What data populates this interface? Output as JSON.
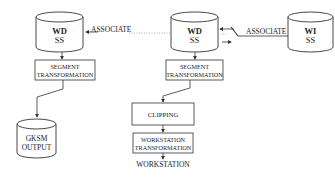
{
  "stores": {
    "wdss_left": {
      "line1": "WD",
      "line2": "SS"
    },
    "wdss_center": {
      "line1": "WD",
      "line2": "SS"
    },
    "wiss": {
      "line1": "WI",
      "line2": "SS"
    },
    "gksm": {
      "line1": "GKSM",
      "line2": "OUTPUT"
    }
  },
  "processes": {
    "seg_left": {
      "line1": "SEGMENT",
      "line2": "TRANSFORMATION"
    },
    "seg_center": {
      "line1": "SEGMENT",
      "line2": "TRANSFORMATION"
    },
    "clipping": {
      "label": "CLIPPING"
    },
    "ws_transform": {
      "line1": "WORKSTATION",
      "line2": "TRANSFORMATION"
    }
  },
  "labels": {
    "associate_left": "ASSOCIATE",
    "associate_right": "ASSOCIATE",
    "workstation_output": "WORKSTATION"
  },
  "colors": {
    "stroke": "#333333",
    "dotted": "#999999",
    "background": "#ffffff"
  }
}
